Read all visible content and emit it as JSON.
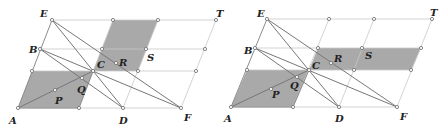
{
  "figures": [
    {
      "id": "left",
      "points": {
        "A": [
          18,
          108
        ],
        "M1": [
          79,
          108
        ],
        "D": [
          123,
          108
        ],
        "F": [
          181,
          108
        ],
        "G1": [
          32,
          71
        ],
        "C": [
          93,
          71
        ],
        "G2": [
          138,
          71
        ],
        "G3": [
          196,
          71
        ],
        "B": [
          40,
          49
        ],
        "G4": [
          102,
          49
        ],
        "S": [
          146,
          49
        ],
        "G5": [
          205,
          49
        ],
        "E": [
          52,
          20
        ],
        "G6": [
          113,
          20
        ],
        "G7": [
          158,
          20
        ],
        "T": [
          216,
          20
        ],
        "P": [
          55,
          90
        ],
        "Q": [
          82,
          78
        ],
        "R": [
          116,
          63
        ]
      },
      "shaded": [
        [
          "A",
          "M1",
          "C",
          "G1"
        ],
        [
          "C",
          "G6",
          "G7",
          "G2"
        ]
      ],
      "labels": [
        {
          "text": "A",
          "x": 9,
          "y": 124
        },
        {
          "text": "D",
          "x": 119,
          "y": 124
        },
        {
          "text": "F",
          "x": 184,
          "y": 121
        },
        {
          "text": "E",
          "x": 40,
          "y": 17
        },
        {
          "text": "B",
          "x": 29,
          "y": 53
        },
        {
          "text": "C",
          "x": 97,
          "y": 68
        },
        {
          "text": "P",
          "x": 55,
          "y": 104
        },
        {
          "text": "Q",
          "x": 77,
          "y": 93
        },
        {
          "text": "R",
          "x": 119,
          "y": 66
        },
        {
          "text": "S",
          "x": 147,
          "y": 61
        },
        {
          "text": "T",
          "x": 216,
          "y": 17
        }
      ]
    },
    {
      "id": "right",
      "points": {
        "A": [
          231,
          107
        ],
        "M1": [
          293,
          107
        ],
        "D": [
          339,
          107
        ],
        "F": [
          397,
          107
        ],
        "G1": [
          247,
          70
        ],
        "C": [
          309,
          70
        ],
        "G2": [
          354,
          70
        ],
        "G3": [
          411,
          70
        ],
        "B": [
          255,
          48
        ],
        "G4": [
          318,
          48
        ],
        "S": [
          362,
          48
        ],
        "G5": [
          421,
          48
        ],
        "E": [
          267,
          19
        ],
        "G6": [
          329,
          19
        ],
        "G7": [
          374,
          19
        ],
        "T": [
          432,
          19
        ],
        "P": [
          271,
          89
        ],
        "Q": [
          297,
          77
        ],
        "R": [
          331,
          63
        ]
      },
      "shaded": [
        [
          "A",
          "M1",
          "C",
          "G1"
        ],
        [
          "C",
          "G4",
          "G5",
          "G3"
        ]
      ],
      "labels": [
        {
          "text": "A",
          "x": 224,
          "y": 122
        },
        {
          "text": "D",
          "x": 335,
          "y": 122
        },
        {
          "text": "F",
          "x": 400,
          "y": 120
        },
        {
          "text": "E",
          "x": 257,
          "y": 17
        },
        {
          "text": "B",
          "x": 244,
          "y": 54
        },
        {
          "text": "C",
          "x": 312,
          "y": 69
        },
        {
          "text": "P",
          "x": 272,
          "y": 98
        },
        {
          "text": "Q",
          "x": 290,
          "y": 89
        },
        {
          "text": "R",
          "x": 334,
          "y": 62
        },
        {
          "text": "S",
          "x": 365,
          "y": 59
        },
        {
          "text": "T",
          "x": 430,
          "y": 16
        }
      ]
    }
  ],
  "colors": {
    "shade": "#a9a9a9",
    "grid": "#c8c8c8",
    "line": "#777777",
    "label": "#222222"
  }
}
